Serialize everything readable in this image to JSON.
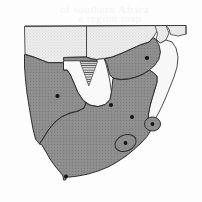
{
  "figure": {
    "background_color": "#fdfdfd"
  },
  "legend_colors": {
    "shaded_country_fill": "#8d8d8d",
    "unshaded_country_fill": "#f6f6f6",
    "outer_country_fill": "#ececec",
    "ocean_fill": "#fdfdfd",
    "border_stroke": "#3a3a3a",
    "coast_stroke": "#2e2e2e",
    "city_marker": "#141414",
    "hatch_stroke": "#4a4a4a"
  },
  "countries": [
    {
      "id": "angola",
      "name": "Angola",
      "shaded": false,
      "fill": "#ececec"
    },
    {
      "id": "zambia",
      "name": "Zambia",
      "shaded": false,
      "fill": "#ececec"
    },
    {
      "id": "namibia",
      "name": "Namibia",
      "shaded": true,
      "fill": "#8d8d8d"
    },
    {
      "id": "botswana",
      "name": "Botswana",
      "shaded": false,
      "fill": "#f9f9f9"
    },
    {
      "id": "zimbabwe",
      "name": "Zimbabwe",
      "shaded": true,
      "fill": "#8d8d8d"
    },
    {
      "id": "mozambique",
      "name": "Mozambique",
      "shaded": false,
      "fill": "#f7f7f7"
    },
    {
      "id": "malawi",
      "name": "Malawi",
      "shaded": false,
      "fill": "#f3f3f3"
    },
    {
      "id": "south-africa",
      "name": "South Africa",
      "shaded": true,
      "fill": "#8d8d8d"
    },
    {
      "id": "lesotho",
      "name": "Lesotho",
      "shaded": true,
      "fill": "#8d8d8d"
    },
    {
      "id": "swaziland",
      "name": "Swaziland",
      "shaded": true,
      "fill": "#8d8d8d"
    }
  ],
  "city_markers": [
    {
      "id": "windhoek",
      "name": "Windhoek",
      "x": 57.5,
      "y": 96.0,
      "r": 2.1
    },
    {
      "id": "harare",
      "name": "Harare",
      "x": 147.0,
      "y": 58.0,
      "r": 2.1
    },
    {
      "id": "gaborone",
      "name": "Gaborone",
      "x": 111.0,
      "y": 105.0,
      "r": 2.0
    },
    {
      "id": "pretoria",
      "name": "Pretoria",
      "x": 132.0,
      "y": 117.0,
      "r": 2.0
    },
    {
      "id": "mbabane",
      "name": "Mbabane",
      "x": 152.5,
      "y": 124.0,
      "r": 1.9
    },
    {
      "id": "maseru",
      "name": "Maseru",
      "x": 125.5,
      "y": 143.0,
      "r": 1.9
    },
    {
      "id": "cape-town",
      "name": "Cape Town",
      "x": 66.0,
      "y": 176.5,
      "r": 2.0
    }
  ],
  "enclaves": [
    {
      "id": "lesotho-outline",
      "name": "Lesotho",
      "cx": 125.5,
      "cy": 143.0,
      "rx": 11.0,
      "ry": 8.0,
      "rotation": -22
    },
    {
      "id": "swaziland-outline",
      "name": "Swaziland",
      "cx": 152.5,
      "cy": 124.0,
      "rx": 8.0,
      "ry": 7.0,
      "rotation": 0
    }
  ],
  "hatched_region": {
    "id": "okavango-delta",
    "name": "Okavango Delta",
    "pattern": "horizontal-lines",
    "line_count": 7
  },
  "ghost_text": [
    {
      "text": "of southern Africa",
      "x": 60,
      "y": 3
    },
    {
      "text": "a region map",
      "x": 78,
      "y": 12
    }
  ]
}
